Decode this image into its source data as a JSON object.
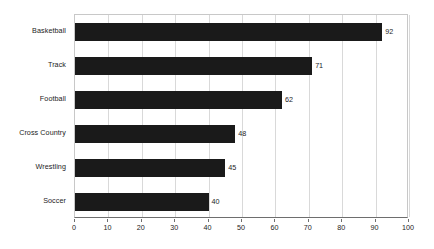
{
  "chart_data": {
    "type": "bar",
    "orientation": "horizontal",
    "title": "",
    "subtitle": "",
    "xlabel": "",
    "ylabel": "",
    "categories": [
      "Basketball",
      "Track",
      "Football",
      "Cross Country",
      "Wrestling",
      "Soccer"
    ],
    "values": [
      92,
      71,
      62,
      48,
      45,
      40
    ],
    "data_labels": [
      "92",
      "71",
      "62",
      "48",
      "45",
      "40"
    ],
    "xlim": [
      0,
      100
    ],
    "xticks": [
      0,
      10,
      20,
      30,
      40,
      50,
      60,
      70,
      80,
      90,
      100
    ],
    "xtick_labels": [
      "0",
      "10",
      "20",
      "30",
      "40",
      "50",
      "60",
      "70",
      "80",
      "90",
      "100"
    ],
    "grid": "vertical",
    "legend": "none",
    "bar_color": "#1a1a1a",
    "gridline_color": "#d9d9d9",
    "axis_color": "#6e6e6e",
    "plot_border_color": "#c8c8c8",
    "background_color": "#ffffff",
    "text_color": "#1c1c1c"
  }
}
